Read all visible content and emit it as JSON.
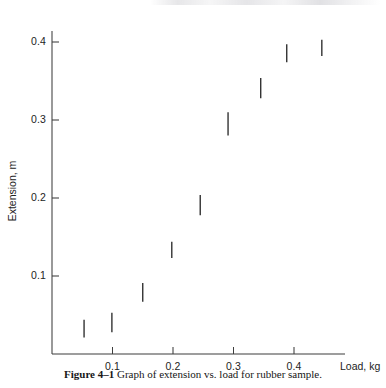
{
  "figure": {
    "caption_label": "Figure 4–1",
    "caption_text": "Graph of extension vs. load for rubber sample."
  },
  "chart_data": {
    "type": "scatter",
    "title": "",
    "subtitle": "",
    "xlabel": "Load, kg",
    "ylabel": "Extension, m",
    "xlim": [
      0,
      0.48
    ],
    "ylim": [
      0,
      0.45
    ],
    "xticks": [
      0.1,
      0.2,
      0.3,
      0.4
    ],
    "xtick_labels": [
      "0.1",
      "0.2",
      "0.3",
      "0.4"
    ],
    "yticks": [
      0.1,
      0.2,
      0.3,
      0.4
    ],
    "ytick_labels": [
      "0.1",
      "0.2",
      "0.3",
      "0.4"
    ],
    "grid": false,
    "legend": null,
    "marker_style": "vertical-bar-uncertainty",
    "series": [
      {
        "name": "rubber sample",
        "color": "#2b2b2b",
        "x": [
          0.053,
          0.099,
          0.15,
          0.198,
          0.245,
          0.291,
          0.345,
          0.388,
          0.446
        ],
        "y": [
          0.033,
          0.041,
          0.079,
          0.134,
          0.191,
          0.295,
          0.341,
          0.386,
          0.393
        ],
        "y_low": [
          0.021,
          0.028,
          0.067,
          0.123,
          0.178,
          0.28,
          0.328,
          0.374,
          0.382
        ],
        "y_high": [
          0.044,
          0.053,
          0.091,
          0.144,
          0.204,
          0.31,
          0.354,
          0.397,
          0.403
        ]
      }
    ],
    "annotations": []
  },
  "axes_geometry": {
    "origin_px": [
      52,
      354
    ],
    "x_px_per_unit": 605,
    "y_px_per_unit": 780,
    "y_top_px": 31,
    "x_right_px": 345
  }
}
